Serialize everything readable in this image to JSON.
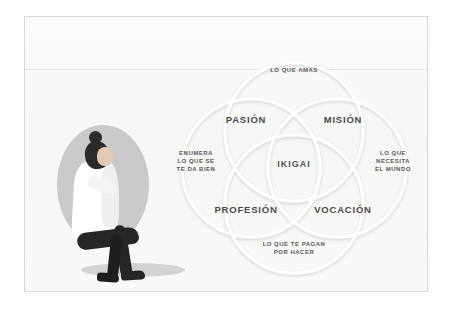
{
  "poster": {
    "title_alt": "Diagrama Ikigai",
    "background_color": "#f8f8f7",
    "frame_color": "#d8d8d6"
  },
  "illustration": {
    "name": "seated-person-illustration",
    "backdrop_color": "#c9c9c9",
    "clothing_color": "#ffffff",
    "hair_color": "#2b2b2b",
    "pants_color": "#262626"
  },
  "diagram": {
    "type": "venn",
    "circle_count": 4,
    "ring_color": "#ffffff",
    "ring_shadow_color": "#d5d5d5",
    "text_color": "#4a4a4a",
    "center": {
      "label": "IKIGAI"
    },
    "quadrants": [
      {
        "key": "pasion",
        "label": "PASIÓN"
      },
      {
        "key": "mision",
        "label": "MISIÓN"
      },
      {
        "key": "profesion",
        "label": "PROFESIÓN"
      },
      {
        "key": "vocacion",
        "label": "VOCACIÓN"
      }
    ],
    "outer_labels": [
      {
        "key": "amas",
        "label": "LO QUE AMAS",
        "position": "top"
      },
      {
        "key": "mundo",
        "label": "LO QUE\nNECESITA\nEL MUNDO",
        "position": "right"
      },
      {
        "key": "pagan",
        "label": "LO QUE TE PAGAN\nPOR HACER",
        "position": "bottom"
      },
      {
        "key": "enumera",
        "label": "ENUMERA\nLO QUE SE\nTE DA BIEN",
        "position": "left"
      }
    ]
  }
}
